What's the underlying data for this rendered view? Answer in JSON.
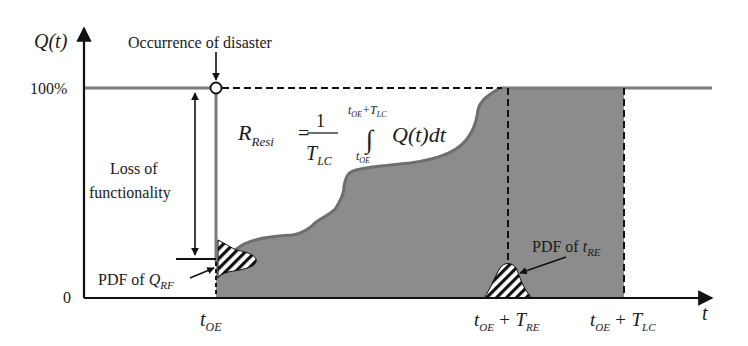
{
  "figure": {
    "type": "resilience-curve-diagram",
    "y_axis": {
      "label": "Q(t)",
      "ticks": [
        {
          "label": "100%",
          "value": 1.0
        },
        {
          "label": "0",
          "value": 0.0
        }
      ]
    },
    "x_axis": {
      "label": "t",
      "ticks": [
        {
          "label_main": "t",
          "label_sub": "OE",
          "suffix_main": "",
          "suffix_sub": ""
        },
        {
          "label_main": "t",
          "label_sub": "OE",
          "suffix_main": "+ T",
          "suffix_sub": "RE"
        },
        {
          "label_main": "t",
          "label_sub": "OE",
          "suffix_main": "+ T",
          "suffix_sub": "LC"
        }
      ]
    },
    "annotations": {
      "disaster": "Occurrence of disaster",
      "loss_line1": "Loss of",
      "loss_line2": "functionality",
      "pdf_q_prefix": "PDF of ",
      "pdf_q_main": "Q",
      "pdf_q_sub": "RF",
      "pdf_t_prefix": "PDF of ",
      "pdf_t_main": "t",
      "pdf_t_sub": "RE"
    },
    "formula": {
      "lhs_main": "R",
      "lhs_sub": "Resi",
      "equals": "=",
      "numerator": "1",
      "denominator_main": "T",
      "denominator_sub": "LC",
      "integral": "∫",
      "upper_limit": "t",
      "upper_limit_sub": "OE",
      "upper_limit_plus": "+T",
      "upper_limit_plus_sub": "LC",
      "lower_limit": "t",
      "lower_limit_sub": "OE",
      "integrand": "Q(t)dt"
    },
    "colors": {
      "fill": "#8c8c8c",
      "curve": "#6e6e6e",
      "axis": "#111111",
      "hundred_line": "#7a7a7a"
    }
  }
}
